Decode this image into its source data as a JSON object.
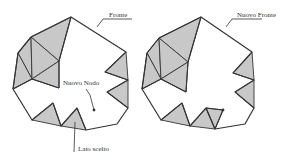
{
  "colors": {
    "stroke": "#333333",
    "fill_shaded": "#c8c8c8",
    "fill_white": "#ffffff",
    "leader": "#333333"
  },
  "labels": {
    "fronte": "Fronte",
    "nuovo_nodo": "Nuovo Nodo",
    "lato_scelto": "Lato scelto",
    "nuovo_fronte": "Nuovo Fronte"
  },
  "diagrams": [
    {
      "name": "before",
      "offset_x": 0,
      "outline": [
        [
          71,
          17
        ],
        [
          126,
          52
        ],
        [
          105,
          72
        ],
        [
          128,
          80
        ],
        [
          107,
          92
        ],
        [
          128,
          108
        ],
        [
          117,
          124
        ],
        [
          86,
          130
        ],
        [
          77,
          108
        ],
        [
          61,
          126
        ],
        [
          53,
          103
        ],
        [
          32,
          120
        ],
        [
          13,
          89
        ],
        [
          18,
          53
        ],
        [
          31,
          37
        ]
      ],
      "shaded_triangles": [
        [
          [
            71,
            17
          ],
          [
            31,
            37
          ],
          [
            59,
            61
          ]
        ],
        [
          [
            31,
            37
          ],
          [
            18,
            53
          ],
          [
            32,
            79
          ]
        ],
        [
          [
            31,
            37
          ],
          [
            59,
            61
          ],
          [
            32,
            79
          ]
        ],
        [
          [
            18,
            53
          ],
          [
            13,
            89
          ],
          [
            32,
            79
          ]
        ],
        [
          [
            32,
            79
          ],
          [
            59,
            61
          ],
          [
            59,
            88
          ]
        ],
        [
          [
            126,
            52
          ],
          [
            105,
            72
          ],
          [
            128,
            80
          ]
        ],
        [
          [
            128,
            80
          ],
          [
            107,
            92
          ],
          [
            128,
            108
          ]
        ],
        [
          [
            32,
            120
          ],
          [
            53,
            103
          ],
          [
            61,
            126
          ]
        ],
        [
          [
            61,
            126
          ],
          [
            77,
            108
          ],
          [
            86,
            130
          ]
        ]
      ],
      "front_edges": [
        [
          [
            71,
            17
          ],
          [
            59,
            61
          ]
        ],
        [
          [
            59,
            61
          ],
          [
            59,
            88
          ]
        ],
        [
          [
            59,
            88
          ],
          [
            32,
            79
          ]
        ],
        [
          [
            32,
            79
          ],
          [
            13,
            89
          ]
        ]
      ],
      "node": [
        94,
        110
      ]
    },
    {
      "name": "after",
      "offset_x": 0,
      "outline": [
        [
          201,
          17
        ],
        [
          252,
          52
        ],
        [
          233,
          73
        ],
        [
          254,
          80
        ],
        [
          235,
          92
        ],
        [
          254,
          108
        ],
        [
          245,
          124
        ],
        [
          215,
          129
        ],
        [
          206,
          108
        ],
        [
          190,
          126
        ],
        [
          182,
          103
        ],
        [
          161,
          120
        ],
        [
          142,
          89
        ],
        [
          147,
          53
        ],
        [
          159,
          38
        ]
      ],
      "shaded_triangles": [
        [
          [
            201,
            17
          ],
          [
            159,
            38
          ],
          [
            188,
            62
          ]
        ],
        [
          [
            159,
            38
          ],
          [
            147,
            53
          ],
          [
            161,
            79
          ]
        ],
        [
          [
            159,
            38
          ],
          [
            188,
            62
          ],
          [
            161,
            79
          ]
        ],
        [
          [
            147,
            53
          ],
          [
            142,
            89
          ],
          [
            161,
            79
          ]
        ],
        [
          [
            161,
            79
          ],
          [
            188,
            62
          ],
          [
            186,
            92
          ]
        ],
        [
          [
            252,
            52
          ],
          [
            233,
            73
          ],
          [
            254,
            80
          ]
        ],
        [
          [
            254,
            80
          ],
          [
            235,
            92
          ],
          [
            254,
            108
          ]
        ],
        [
          [
            161,
            120
          ],
          [
            182,
            103
          ],
          [
            190,
            126
          ]
        ],
        [
          [
            190,
            126
          ],
          [
            206,
            108
          ],
          [
            215,
            129
          ]
        ],
        [
          [
            206,
            108
          ],
          [
            223,
            110
          ],
          [
            215,
            129
          ]
        ]
      ],
      "front_edges": [
        [
          [
            201,
            17
          ],
          [
            188,
            62
          ]
        ],
        [
          [
            188,
            62
          ],
          [
            186,
            92
          ]
        ],
        [
          [
            186,
            92
          ],
          [
            161,
            79
          ]
        ],
        [
          [
            161,
            79
          ],
          [
            142,
            89
          ]
        ],
        [
          [
            206,
            108
          ],
          [
            223,
            110
          ]
        ],
        [
          [
            223,
            110
          ],
          [
            215,
            129
          ]
        ]
      ],
      "node": [
        223,
        110
      ]
    }
  ],
  "leaders": {
    "fronte": [
      [
        97,
        27
      ],
      [
        103,
        19
      ],
      [
        132,
        19
      ]
    ],
    "nuovo_nodo": [
      [
        86,
        89
      ],
      [
        90,
        95
      ],
      [
        94,
        110
      ]
    ],
    "lato_scelto": [
      [
        75,
        122
      ],
      [
        74,
        152
      ]
    ],
    "nuovo_fronte": [
      [
        226,
        27
      ],
      [
        232,
        19
      ],
      [
        262,
        19
      ]
    ]
  },
  "label_positions": {
    "fronte": [
      109,
      12
    ],
    "nuovo_nodo": [
      63,
      80
    ],
    "lato_scelto": [
      78,
      146
    ],
    "nuovo_fronte": [
      237,
      12
    ]
  }
}
